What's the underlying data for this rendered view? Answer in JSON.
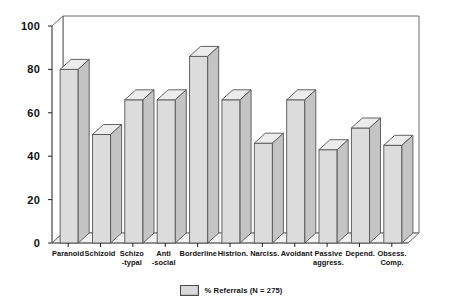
{
  "chart_data": {
    "type": "bar",
    "title": "",
    "xlabel": "",
    "ylabel": "",
    "ylim": [
      0,
      100
    ],
    "yticks": [
      0,
      20,
      40,
      60,
      80,
      100
    ],
    "grid": false,
    "legend_position": "bottom-center",
    "style": "3d-bars",
    "categories": [
      "Paranoid",
      "Schizo -typal",
      "Schizoid",
      "Anti -social",
      "Borderline",
      "Histrion.",
      "Narciss.",
      "Avoidant",
      "Passive aggress.",
      "Depend.",
      "Obsess. Comp."
    ],
    "category_lines": [
      [
        "Paranoid"
      ],
      [
        "Schizoid"
      ],
      [
        "Schizo",
        "-typal"
      ],
      [
        "Anti",
        "-social"
      ],
      [
        "Borderline"
      ],
      [
        "Histrion."
      ],
      [
        "Narciss."
      ],
      [
        "Avoidant"
      ],
      [
        "Passive",
        "aggress."
      ],
      [
        "Depend."
      ],
      [
        "Obsess.",
        "Comp."
      ]
    ],
    "series": [
      {
        "name": "% Referrals (N = 275)",
        "values": [
          80,
          50,
          66,
          66,
          86,
          66,
          46,
          66,
          43,
          53,
          45
        ]
      }
    ]
  },
  "legend": {
    "label": "% Referrals (N = 275)",
    "swatch_color": "#d9d9d9"
  },
  "colors": {
    "bar_face": "#dcdcdc",
    "bar_top": "#ececec",
    "bar_side": "#c4c4c4",
    "axis": "#222222",
    "frame": "#6b6b6b",
    "background": "#ffffff"
  }
}
